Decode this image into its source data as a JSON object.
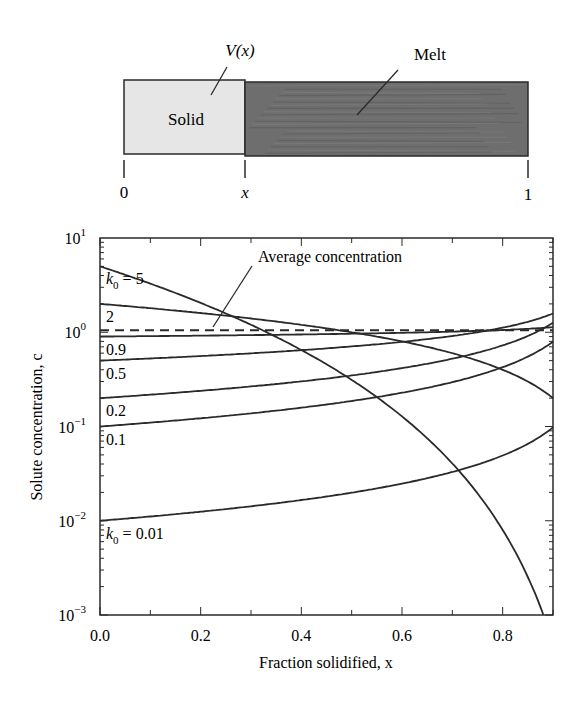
{
  "diagram": {
    "solid_label": "Solid",
    "melt_label": "Melt",
    "interface_label": "V(x)",
    "axis_ticks": [
      "0",
      "x",
      "1"
    ],
    "solid_color": "#e6e6e6",
    "melt_color": "#6e6e6e"
  },
  "chart_data": {
    "type": "line",
    "title": "",
    "xlabel": "Fraction solidified, x",
    "ylabel": "Solute concentration, c",
    "xlim": [
      0.0,
      0.9
    ],
    "ylim": [
      0.001,
      10
    ],
    "yscale": "log",
    "xticks": [
      "0.0",
      "0.2",
      "0.4",
      "0.6",
      "0.8"
    ],
    "yticks": [
      "10^-3",
      "10^-2",
      "10^-1",
      "10^0",
      "10^1"
    ],
    "grid": false,
    "model": "c = k0 * (1 - x)^(k0 - 1)",
    "x": [
      0.0,
      0.1,
      0.2,
      0.3,
      0.4,
      0.5,
      0.6,
      0.7,
      0.8,
      0.9
    ],
    "series": [
      {
        "name": "k0 = 5",
        "label": "k",
        "label_sub": "0",
        "label_rest": " = 5",
        "k0": 5,
        "values": [
          5.0,
          3.28,
          2.05,
          1.2,
          0.648,
          0.3125,
          0.128,
          0.0405,
          0.008,
          0.0005
        ]
      },
      {
        "name": "k0 = 2",
        "label": "2",
        "k0": 2,
        "values": [
          2.0,
          1.8,
          1.6,
          1.4,
          1.2,
          1.0,
          0.8,
          0.6,
          0.4,
          0.2
        ]
      },
      {
        "name": "k0 = 0.9",
        "label": "0.9",
        "k0": 0.9,
        "values": [
          0.9,
          0.909,
          0.92,
          0.932,
          0.947,
          0.965,
          0.988,
          1.019,
          1.058,
          1.134
        ]
      },
      {
        "name": "k0 = 0.5",
        "label": "0.5",
        "k0": 0.5,
        "values": [
          0.5,
          0.527,
          0.559,
          0.598,
          0.645,
          0.707,
          0.791,
          0.913,
          1.118,
          1.581
        ]
      },
      {
        "name": "k0 = 0.2",
        "label": "0.2",
        "k0": 0.2,
        "values": [
          0.2,
          0.218,
          0.239,
          0.265,
          0.301,
          0.348,
          0.416,
          0.524,
          0.724,
          1.262
        ]
      },
      {
        "name": "k0 = 0.1",
        "label": "0.1",
        "k0": 0.1,
        "values": [
          0.1,
          0.11,
          0.122,
          0.138,
          0.158,
          0.187,
          0.228,
          0.295,
          0.426,
          0.794
        ]
      },
      {
        "name": "k0 = 0.01",
        "label": "k",
        "label_sub": "0",
        "label_rest": " = 0.01",
        "k0": 0.01,
        "values": [
          0.01,
          0.0111,
          0.0125,
          0.0143,
          0.0166,
          0.0199,
          0.0248,
          0.033,
          0.0494,
          0.0977
        ]
      }
    ],
    "reference_line": {
      "name": "Average concentration",
      "y": 1.0,
      "style": "dashed"
    },
    "annotations": [
      {
        "text": "Average concentration",
        "points_to": [
          0.24,
          1.0
        ]
      }
    ]
  }
}
